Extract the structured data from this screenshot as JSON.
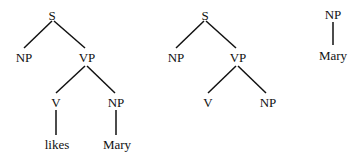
{
  "trees": [
    {
      "id": "tree-1",
      "nodes": {
        "S": "S",
        "NP_subj": "NP",
        "VP": "VP",
        "V": "V",
        "NP_obj": "NP",
        "verb": "likes",
        "obj": "Mary"
      }
    },
    {
      "id": "tree-2",
      "nodes": {
        "S": "S",
        "NP_subj": "NP",
        "VP": "VP",
        "V": "V",
        "NP_obj": "NP"
      }
    },
    {
      "id": "tree-3",
      "nodes": {
        "NP": "NP",
        "obj": "Mary"
      }
    }
  ]
}
